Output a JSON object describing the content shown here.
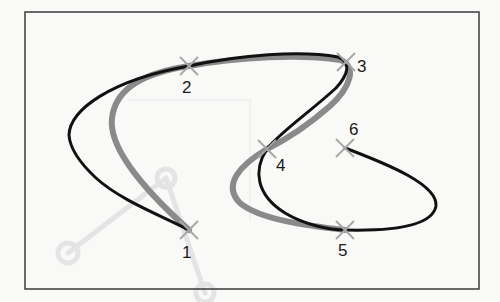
{
  "diagram": {
    "type": "spline-curve-through-control-points",
    "frame": {
      "x": 25,
      "y": 12,
      "width": 454,
      "height": 277,
      "stroke": "#3a3a3a"
    },
    "colors": {
      "background": "#f9f9f8",
      "black_curve": "#111111",
      "gray_curve": "#8a8a8a",
      "marker": "#a8a8a8",
      "ghost": "#e6e6e6"
    },
    "points": [
      {
        "id": "1",
        "label": "1",
        "x": 189,
        "y": 230,
        "label_x": 182,
        "label_y": 258
      },
      {
        "id": "2",
        "label": "2",
        "x": 189,
        "y": 66,
        "label_x": 182,
        "label_y": 93
      },
      {
        "id": "3",
        "label": "3",
        "x": 346,
        "y": 62,
        "label_x": 357,
        "label_y": 72
      },
      {
        "id": "4",
        "label": "4",
        "x": 267,
        "y": 149,
        "label_x": 276,
        "label_y": 171
      },
      {
        "id": "5",
        "label": "5",
        "x": 345,
        "y": 230,
        "label_x": 338,
        "label_y": 256
      },
      {
        "id": "6",
        "label": "6",
        "x": 345,
        "y": 148,
        "label_x": 349,
        "label_y": 135
      }
    ],
    "curves": [
      {
        "name": "black-curve",
        "description": "Curve passing through points 1-2-3-4-5-6 with wide overshoot"
      },
      {
        "name": "gray-curve",
        "description": "Tighter curve through points 1-2-3-4-5"
      }
    ]
  }
}
